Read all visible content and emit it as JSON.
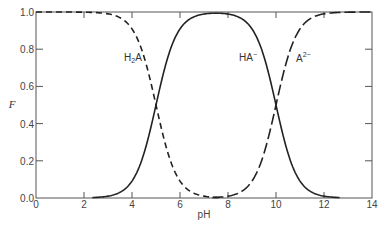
{
  "chart_data": {
    "type": "line",
    "title": "",
    "xlabel": "pH",
    "ylabel": "F",
    "xlim": [
      0,
      14
    ],
    "ylim": [
      0.0,
      1.0
    ],
    "xticks": [
      0,
      2,
      4,
      6,
      8,
      10,
      12,
      14
    ],
    "yticks": [
      0.0,
      0.2,
      0.4,
      0.6,
      0.8,
      1.0
    ],
    "xtick_labels": [
      "0",
      "2",
      "4",
      "6",
      "8",
      "10",
      "12",
      "14"
    ],
    "ytick_labels": [
      "0.0",
      "0.2",
      "0.4",
      "0.6",
      "0.8",
      "1.0"
    ],
    "grid": false,
    "pKa": [
      5,
      10
    ],
    "x": [
      0,
      2,
      3,
      4,
      4.5,
      5,
      5.5,
      6,
      7,
      7.5,
      8,
      9,
      9.5,
      10,
      10.5,
      11,
      12,
      14
    ],
    "series": [
      {
        "name": "H2A",
        "label": "H₂A",
        "style": "dashed",
        "values": [
          1.0,
          1.0,
          0.99,
          0.91,
          0.76,
          0.5,
          0.24,
          0.09,
          0.01,
          0.003,
          0.001,
          0.0,
          0.0,
          0.0,
          0.0,
          0.0,
          0.0,
          0.0
        ]
      },
      {
        "name": "HA-",
        "label": "HA⁻",
        "style": "solid",
        "values": [
          0.0,
          0.001,
          0.01,
          0.09,
          0.24,
          0.5,
          0.76,
          0.91,
          0.99,
          0.995,
          0.99,
          0.91,
          0.76,
          0.5,
          0.24,
          0.09,
          0.01,
          0.0
        ]
      },
      {
        "name": "A2-",
        "label": "A²⁻",
        "style": "long-dashed",
        "values": [
          0.0,
          0.0,
          0.0,
          0.0,
          0.0,
          0.0,
          0.0,
          0.0,
          0.0,
          0.003,
          0.01,
          0.09,
          0.24,
          0.5,
          0.76,
          0.91,
          0.99,
          1.0
        ]
      }
    ],
    "annotations": [
      {
        "text": "H₂A",
        "x": 3.7,
        "y": 0.73
      },
      {
        "text": "HA⁻",
        "x": 8.8,
        "y": 0.73
      },
      {
        "text": "A²⁻",
        "x": 11.2,
        "y": 0.74
      }
    ]
  },
  "labels": {
    "xlabel": "pH",
    "ylabel": "F",
    "h2a_main": "H",
    "h2a_sub": "2",
    "h2a_tail": "A",
    "ha_main": "HA",
    "ha_sup": "−",
    "a_main": "A",
    "a_sup": "2−"
  }
}
